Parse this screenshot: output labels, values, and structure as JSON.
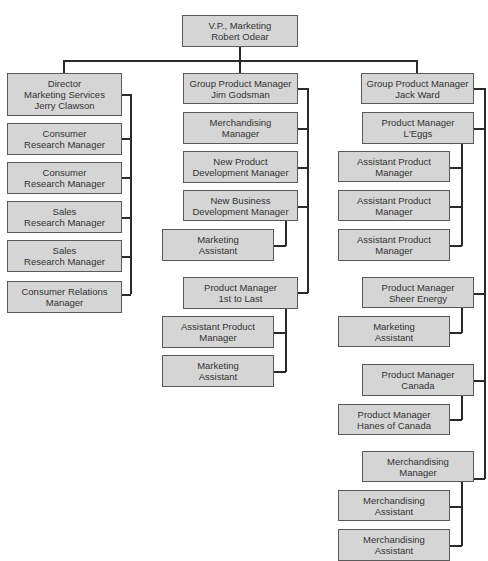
{
  "chart": {
    "type": "org_chart",
    "root": {
      "title": "V.P., Marketing",
      "name": "Robert Odear"
    },
    "left": {
      "head": {
        "line1": "Director",
        "line2": "Marketing Services",
        "line3": "Jerry Clawson"
      },
      "items": [
        {
          "line1": "Consumer",
          "line2": "Research Manager"
        },
        {
          "line1": "Consumer",
          "line2": "Research Manager"
        },
        {
          "line1": "Sales",
          "line2": "Research Manager"
        },
        {
          "line1": "Sales",
          "line2": "Research Manager"
        },
        {
          "line1": "Consumer Relations",
          "line2": "Manager"
        }
      ]
    },
    "middle": {
      "head": {
        "line1": "Group Product Manager",
        "line2": "Jim Godsman"
      },
      "merch": {
        "line1": "Merchandising",
        "line2": "Manager"
      },
      "npd": {
        "line1": "New Product",
        "line2": "Development Manager"
      },
      "nbd": {
        "line1": "New Business",
        "line2": "Development Manager"
      },
      "nbd_assistant": {
        "line1": "Marketing",
        "line2": "Assistant"
      },
      "pm": {
        "line1": "Product Manager",
        "line2": "1st to Last"
      },
      "pm_apm": {
        "line1": "Assistant Product",
        "line2": "Manager"
      },
      "pm_ma": {
        "line1": "Marketing",
        "line2": "Assistant"
      }
    },
    "right": {
      "head": {
        "line1": "Group Product Manager",
        "line2": "Jack Ward"
      },
      "leggs": {
        "line1": "Product Manager",
        "line2": "L'Eggs"
      },
      "leggs_apm": [
        {
          "line1": "Assistant Product",
          "line2": "Manager"
        },
        {
          "line1": "Assistant Product",
          "line2": "Manager"
        },
        {
          "line1": "Assistant Product",
          "line2": "Manager"
        }
      ],
      "sheer": {
        "line1": "Product Manager",
        "line2": "Sheer Energy"
      },
      "sheer_ma": {
        "line1": "Marketing",
        "line2": "Assistant"
      },
      "canada": {
        "line1": "Product Manager",
        "line2": "Canada"
      },
      "hanes": {
        "line1": "Product Manager",
        "line2": "Hanes of Canada"
      },
      "merch": {
        "line1": "Merchandising",
        "line2": "Manager"
      },
      "merch_assistants": [
        {
          "line1": "Merchandising",
          "line2": "Assistant"
        },
        {
          "line1": "Merchandising",
          "line2": "Assistant"
        }
      ]
    }
  }
}
